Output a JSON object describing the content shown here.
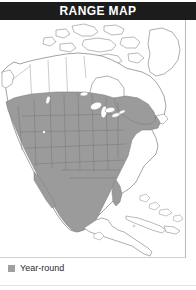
{
  "header": {
    "title": "RANGE MAP",
    "background_color": "#1c1c1c",
    "text_color": "#ffffff"
  },
  "map": {
    "name": "north-america-range-map",
    "projection_note": "North America, Central America and Caribbean",
    "land_outline_color": "#8c8c8c",
    "land_fill_color": "#ffffff",
    "range_fill_color": "#9b9b9b",
    "internal_border_color": "#7a7a7a",
    "water_color": "#ffffff",
    "frame_border_color": "#b9b9b9",
    "regions_shaded": [
      "Southern Canada",
      "Contiguous United States",
      "Northern and central Mexico",
      "Baja California"
    ],
    "regions_unshaded": [
      "Alaska",
      "Northern Canada",
      "Canadian Arctic Archipelago",
      "Greenland",
      "Southern Mexico",
      "Central America",
      "Cuba",
      "Hispaniola",
      "Bahamas"
    ]
  },
  "legend": {
    "items": [
      {
        "label": "Year-round",
        "swatch_color": "#a0a0a0"
      }
    ]
  }
}
